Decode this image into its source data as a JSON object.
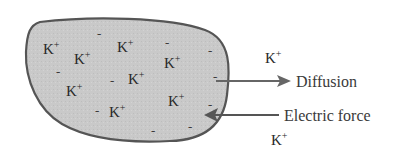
{
  "diagram": {
    "cell": {
      "fill": "#c9c9c9",
      "stroke": "#555555",
      "inside_ions": [
        {
          "base": "K",
          "charge": "+",
          "x": 43,
          "y": 54
        },
        {
          "base": "K",
          "charge": "+",
          "x": 74,
          "y": 64
        },
        {
          "base": "K",
          "charge": "+",
          "x": 117,
          "y": 52
        },
        {
          "base": "K",
          "charge": "+",
          "x": 66,
          "y": 96
        },
        {
          "base": "K",
          "charge": "+",
          "x": 128,
          "y": 84
        },
        {
          "base": "K",
          "charge": "+",
          "x": 164,
          "y": 68
        },
        {
          "base": "K",
          "charge": "+",
          "x": 109,
          "y": 117
        },
        {
          "base": "K",
          "charge": "+",
          "x": 168,
          "y": 106
        }
      ],
      "minus_charges": [
        {
          "symbol": "-",
          "x": 97,
          "y": 38
        },
        {
          "symbol": "-",
          "x": 56,
          "y": 76
        },
        {
          "symbol": "-",
          "x": 110,
          "y": 85
        },
        {
          "symbol": "-",
          "x": 165,
          "y": 47
        },
        {
          "symbol": "-",
          "x": 208,
          "y": 55
        },
        {
          "symbol": "-",
          "x": 213,
          "y": 81
        },
        {
          "symbol": "-",
          "x": 95,
          "y": 115
        },
        {
          "symbol": "-",
          "x": 208,
          "y": 109
        },
        {
          "symbol": "-",
          "x": 151,
          "y": 135
        },
        {
          "symbol": "-",
          "x": 188,
          "y": 131
        }
      ]
    },
    "outside_ions": [
      {
        "base": "K",
        "charge": "+",
        "x": 265,
        "y": 63
      },
      {
        "base": "K",
        "charge": "+",
        "x": 271,
        "y": 145
      }
    ],
    "arrows": {
      "diffusion": {
        "label": "Diffusion",
        "direction": "outward",
        "color": "#666666"
      },
      "electric_force": {
        "label": "Electric force",
        "direction": "inward",
        "color": "#555555"
      }
    }
  }
}
